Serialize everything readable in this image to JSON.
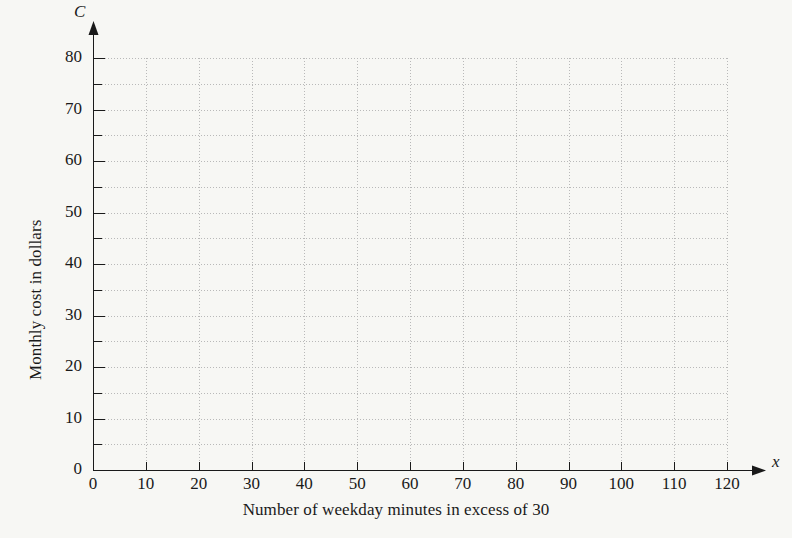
{
  "chart_data": {
    "type": "line",
    "title": "",
    "subtitle": "",
    "xlabel": "Number of weekday minutes in excess of 30",
    "ylabel": "Monthly cost in dollars",
    "x_axis_variable": "x",
    "y_axis_variable": "C",
    "xlim": [
      0,
      120
    ],
    "ylim": [
      0,
      80
    ],
    "x_ticks": [
      0,
      10,
      20,
      30,
      40,
      50,
      60,
      70,
      80,
      90,
      100,
      110,
      120
    ],
    "x_tick_labels": [
      "0",
      "10",
      "20",
      "30",
      "40",
      "50",
      "60",
      "70",
      "80",
      "90",
      "100",
      "110",
      "120"
    ],
    "y_ticks": [
      0,
      10,
      20,
      30,
      40,
      50,
      60,
      70,
      80
    ],
    "y_tick_labels": [
      "0",
      "10",
      "20",
      "30",
      "40",
      "50",
      "60",
      "70",
      "80"
    ],
    "y_minor_ticks": [
      5,
      15,
      25,
      35,
      45,
      55,
      65,
      75
    ],
    "x_grid_step": 10,
    "y_grid_step": 5,
    "grid": true,
    "legend": null,
    "series": [],
    "annotations": [],
    "note": "Empty coordinate grid; no data plotted"
  },
  "colors": {
    "background": "#f7f7f4",
    "ink": "#1a1a1a",
    "grid": "#b9b9b9"
  }
}
